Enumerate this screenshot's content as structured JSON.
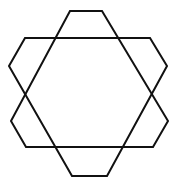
{
  "figure": {
    "stroke_color": "#111111",
    "background": "#ffffff",
    "shapes": [
      {
        "name": "hexagon-a",
        "points": "70,11 102,11 168,121 153,147 26,147 11,121"
      },
      {
        "name": "hexagon-b",
        "points": "25,38 150,38 167,66 107,176 72,176 9,66"
      }
    ]
  }
}
